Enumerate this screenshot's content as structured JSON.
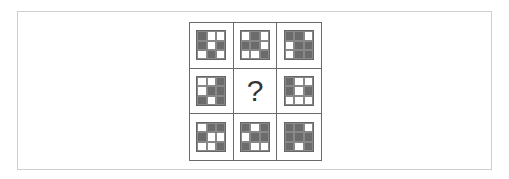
{
  "puzzle": {
    "missing_symbol": "?",
    "colors": {
      "dark": "#6b6b6b",
      "light": "#ffffff",
      "border": "#6a6a6a"
    },
    "cells": [
      {
        "row": 1,
        "col": 1,
        "pattern": [
          [
            1,
            0,
            0
          ],
          [
            1,
            0,
            1
          ],
          [
            0,
            1,
            0
          ]
        ]
      },
      {
        "row": 1,
        "col": 2,
        "pattern": [
          [
            0,
            1,
            0
          ],
          [
            1,
            1,
            0
          ],
          [
            0,
            0,
            1
          ]
        ]
      },
      {
        "row": 1,
        "col": 3,
        "pattern": [
          [
            1,
            1,
            0
          ],
          [
            0,
            1,
            1
          ],
          [
            0,
            1,
            1
          ]
        ]
      },
      {
        "row": 2,
        "col": 1,
        "pattern": [
          [
            0,
            0,
            1
          ],
          [
            0,
            1,
            1
          ],
          [
            1,
            0,
            1
          ]
        ]
      },
      {
        "row": 2,
        "col": 2,
        "pattern": null
      },
      {
        "row": 2,
        "col": 3,
        "pattern": [
          [
            1,
            0,
            0
          ],
          [
            1,
            0,
            1
          ],
          [
            0,
            0,
            0
          ]
        ]
      },
      {
        "row": 3,
        "col": 1,
        "pattern": [
          [
            0,
            1,
            1
          ],
          [
            1,
            0,
            0
          ],
          [
            0,
            0,
            1
          ]
        ]
      },
      {
        "row": 3,
        "col": 2,
        "pattern": [
          [
            1,
            0,
            1
          ],
          [
            0,
            1,
            1
          ],
          [
            1,
            0,
            0
          ]
        ]
      },
      {
        "row": 3,
        "col": 3,
        "pattern": [
          [
            1,
            1,
            0
          ],
          [
            1,
            1,
            1
          ],
          [
            1,
            0,
            1
          ]
        ]
      }
    ]
  }
}
